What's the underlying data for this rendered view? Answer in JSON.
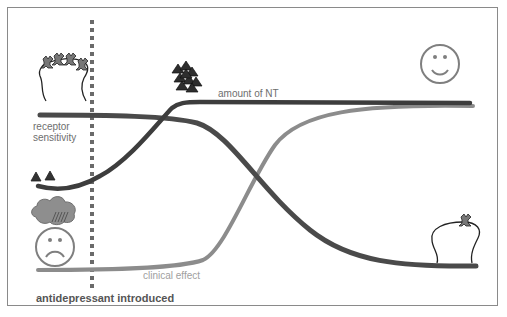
{
  "diagram": {
    "labels": {
      "receptor_sensitivity_line1": "receptor",
      "receptor_sensitivity_line2": "sensitivity",
      "amount_of_nt": "amount of NT",
      "clinical_effect": "clinical effect",
      "antidepressant_introduced": "antidepressant introduced"
    },
    "curves": [
      {
        "name": "amount of NT",
        "color": "#3d3d3d",
        "trend": "low → rises sharply after antidepressant → plateau high"
      },
      {
        "name": "receptor sensitivity",
        "color": "#4a4a4a",
        "trend": "high → declines in middle → low plateau"
      },
      {
        "name": "clinical effect",
        "color": "#8c8c8c",
        "trend": "low → delayed rise → high plateau"
      }
    ],
    "markers": {
      "antidepressant_line": {
        "style": "dotted",
        "color": "#666666"
      }
    },
    "icons": [
      "receptor-cluster-icon",
      "neurotransmitter-pair-icon",
      "rain-cloud-icon",
      "sad-face-icon",
      "neurotransmitter-cluster-icon",
      "happy-face-icon",
      "single-receptor-icon"
    ],
    "colors": {
      "dark_line": "#454545",
      "light_line": "#8c8c8c",
      "frame": "#8a8a8a",
      "face": "#7f7f7f"
    }
  }
}
